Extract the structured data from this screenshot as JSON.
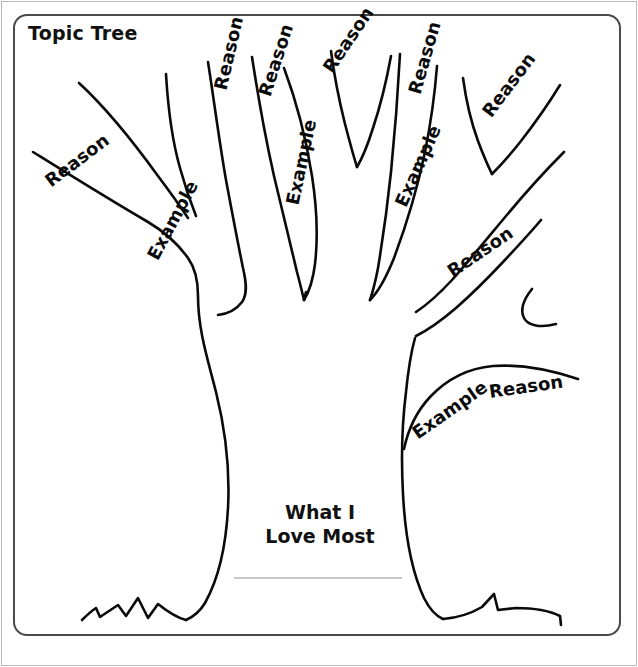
{
  "worksheet": {
    "title": "Topic Tree",
    "center_prompt_line1": "What I",
    "center_prompt_line2": "Love Most",
    "answer_rule": ""
  },
  "colors": {
    "ink": "#0a0a0a",
    "frame": "#4a4a4a",
    "page_border": "#b9b9b9",
    "rule": "#c9c9c9",
    "background": "#ffffff"
  },
  "labels": {
    "reason": "Reason",
    "example": "Example"
  },
  "branch_labels": [
    {
      "id": "left-outer-reason",
      "text": "Reason",
      "x": 47,
      "y": 172,
      "rotate": -37
    },
    {
      "id": "left-outer-example",
      "text": "Example",
      "x": 152,
      "y": 248,
      "rotate": -62
    },
    {
      "id": "center-left-reason",
      "text": "Reason",
      "x": 220,
      "y": 79,
      "rotate": -77
    },
    {
      "id": "center-mid-reason",
      "text": "Reason",
      "x": 264,
      "y": 85,
      "rotate": -72
    },
    {
      "id": "center-mid-example",
      "text": "Example",
      "x": 292,
      "y": 194,
      "rotate": -78
    },
    {
      "id": "center-top-reason",
      "text": "Reason",
      "x": 327,
      "y": 60,
      "rotate": -56
    },
    {
      "id": "center-right-reason",
      "text": "Reason",
      "x": 414,
      "y": 83,
      "rotate": -74
    },
    {
      "id": "center-right-example",
      "text": "Example",
      "x": 400,
      "y": 195,
      "rotate": -66
    },
    {
      "id": "right-upper-reason",
      "text": "Reason",
      "x": 486,
      "y": 104,
      "rotate": -53
    },
    {
      "id": "right-lower-reason",
      "text": "Reason",
      "x": 449,
      "y": 262,
      "rotate": -34
    },
    {
      "id": "base-right-example",
      "text": "Example",
      "x": 414,
      "y": 424,
      "rotate": -35
    },
    {
      "id": "base-right-reason",
      "text": "Reason",
      "x": 489,
      "y": 381,
      "rotate": -8
    }
  ]
}
